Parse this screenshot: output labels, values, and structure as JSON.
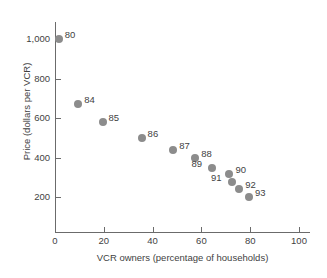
{
  "chart_data": {
    "type": "scatter",
    "title": "",
    "xlabel": "VCR owners (percentage of households)",
    "ylabel": "Price (dollars per VCR)",
    "xlim": [
      0,
      105
    ],
    "ylim": [
      120,
      1060
    ],
    "xticks": [
      "0",
      "20",
      "40",
      "60",
      "80",
      "100"
    ],
    "xtick_values": [
      0,
      20,
      40,
      60,
      80,
      100
    ],
    "yticks": [
      "200",
      "400",
      "600",
      "800",
      "1,000"
    ],
    "ytick_values": [
      200,
      400,
      600,
      800,
      1000
    ],
    "grid": false,
    "legend": "none",
    "marker_color": "#8c8c8c",
    "points": [
      {
        "label": "80",
        "x": 1.5,
        "y": 1000,
        "label_side": "right"
      },
      {
        "label": "84",
        "x": 9.5,
        "y": 670,
        "label_side": "right"
      },
      {
        "label": "85",
        "x": 19.5,
        "y": 580,
        "label_side": "right"
      },
      {
        "label": "86",
        "x": 35.5,
        "y": 500,
        "label_side": "right"
      },
      {
        "label": "87",
        "x": 48.5,
        "y": 440,
        "label_side": "right"
      },
      {
        "label": "88",
        "x": 57.5,
        "y": 398,
        "label_side": "right"
      },
      {
        "label": "89",
        "x": 64.5,
        "y": 348,
        "label_side": "left"
      },
      {
        "label": "90",
        "x": 71.5,
        "y": 317,
        "label_side": "right"
      },
      {
        "label": "91",
        "x": 72.5,
        "y": 278,
        "label_side": "left"
      },
      {
        "label": "92",
        "x": 75.5,
        "y": 243,
        "label_side": "right"
      },
      {
        "label": "93",
        "x": 79.5,
        "y": 200,
        "label_side": "right"
      }
    ]
  }
}
